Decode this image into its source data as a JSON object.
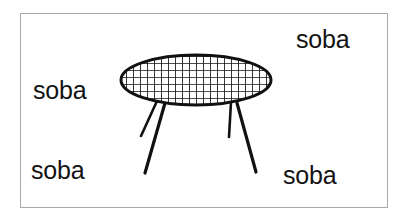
{
  "canvas": {
    "width": 404,
    "height": 221,
    "background_color": "#ffffff"
  },
  "frame": {
    "border_color": "#a8a8a8",
    "x": 20,
    "y": 13,
    "width": 368,
    "height": 195
  },
  "illustration": {
    "subject": "table",
    "style": "black line drawing",
    "stroke_color": "#111111",
    "tabletop": {
      "shape": "ellipse",
      "center_x": 196,
      "center_y": 80,
      "radius_x": 75,
      "radius_y": 25,
      "fill_pattern": "cross-hatch grid",
      "grid_spacing": 7
    },
    "legs": [
      {
        "name": "back-left-leg",
        "x1": 157,
        "y1": 101,
        "x2": 141,
        "y2": 136
      },
      {
        "name": "front-left-leg",
        "x1": 165,
        "y1": 103,
        "x2": 145,
        "y2": 173
      },
      {
        "name": "back-right-leg",
        "x1": 231,
        "y1": 102,
        "x2": 229,
        "y2": 137
      },
      {
        "name": "front-right-leg",
        "x1": 237,
        "y1": 103,
        "x2": 256,
        "y2": 172
      }
    ]
  },
  "labels": {
    "top_right": "soba",
    "mid_left": "soba",
    "bottom_left": "soba",
    "bottom_right": "soba",
    "color": "#131313",
    "font_size_px": 25
  }
}
